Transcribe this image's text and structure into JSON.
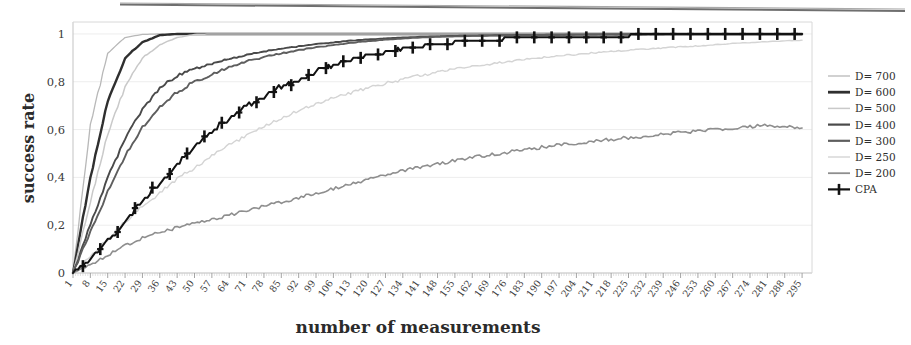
{
  "figure": {
    "background_color": "#ffffff",
    "scan_artifact": {
      "name": "page-edge-streak",
      "color": "#6f6f6f"
    }
  },
  "chart_data": {
    "type": "line",
    "title": "",
    "subtitle": "",
    "xlabel": "number of measurements",
    "ylabel": "success rate",
    "xlim": [
      1,
      299
    ],
    "ylim": [
      0,
      1.05
    ],
    "yticks": [
      0,
      0.2,
      0.4,
      0.6,
      0.8,
      1
    ],
    "ytick_labels": [
      "0",
      "0,2",
      "0,4",
      "0,6",
      "0,8",
      "1"
    ],
    "grid": "horizontal",
    "legend_position": "right",
    "x_tick_step": 7,
    "x": [
      1,
      8,
      15,
      22,
      29,
      36,
      43,
      50,
      57,
      64,
      71,
      78,
      85,
      92,
      99,
      106,
      113,
      120,
      127,
      134,
      141,
      148,
      155,
      162,
      169,
      176,
      183,
      190,
      197,
      204,
      211,
      218,
      225,
      232,
      239,
      246,
      253,
      260,
      267,
      274,
      281,
      288,
      295
    ],
    "xtick_labels": [
      "1",
      "8",
      "15",
      "22",
      "29",
      "36",
      "43",
      "50",
      "57",
      "64",
      "71",
      "78",
      "85",
      "92",
      "99",
      "106",
      "113",
      "120",
      "127",
      "134",
      "141",
      "148",
      "155",
      "162",
      "169",
      "176",
      "183",
      "190",
      "197",
      "204",
      "211",
      "218",
      "225",
      "232",
      "239",
      "246",
      "253",
      "260",
      "267",
      "274",
      "281",
      "288",
      "295"
    ],
    "series": [
      {
        "name": "D=700",
        "label": "D= 700",
        "color": "#b8b8b8",
        "width": 1.3,
        "marker": "none",
        "values": [
          0.0,
          0.62,
          0.92,
          0.985,
          0.998,
          1.0,
          1.0,
          1.0,
          1.0,
          1.0,
          1.0,
          1.0,
          1.0,
          1.0,
          1.0,
          1.0,
          1.0,
          1.0,
          1.0,
          1.0,
          1.0,
          1.0,
          1.0,
          1.0,
          1.0,
          1.0,
          1.0,
          1.0,
          1.0,
          1.0,
          1.0,
          1.0,
          1.0,
          1.0,
          1.0,
          1.0,
          1.0,
          1.0,
          1.0,
          1.0,
          1.0,
          1.0,
          1.0
        ]
      },
      {
        "name": "D=600",
        "label": "D= 600",
        "color": "#2f2f2f",
        "width": 2.4,
        "marker": "none",
        "values": [
          0.0,
          0.4,
          0.72,
          0.9,
          0.965,
          0.995,
          1.0,
          1.0,
          1.0,
          1.0,
          1.0,
          1.0,
          1.0,
          1.0,
          1.0,
          1.0,
          1.0,
          1.0,
          1.0,
          1.0,
          1.0,
          1.0,
          1.0,
          1.0,
          1.0,
          1.0,
          1.0,
          1.0,
          1.0,
          1.0,
          1.0,
          1.0,
          1.0,
          1.0,
          1.0,
          1.0,
          1.0,
          1.0,
          1.0,
          1.0,
          1.0,
          1.0,
          1.0
        ]
      },
      {
        "name": "D=500",
        "label": "D= 500",
        "color": "#c9c9c9",
        "width": 1.5,
        "marker": "none",
        "values": [
          0.0,
          0.3,
          0.58,
          0.78,
          0.9,
          0.955,
          0.985,
          0.998,
          1.0,
          1.0,
          1.0,
          1.0,
          1.0,
          1.0,
          1.0,
          1.0,
          1.0,
          1.0,
          1.0,
          1.0,
          1.0,
          1.0,
          1.0,
          1.0,
          1.0,
          1.0,
          1.0,
          1.0,
          1.0,
          1.0,
          1.0,
          1.0,
          1.0,
          1.0,
          1.0,
          1.0,
          1.0,
          1.0,
          1.0,
          1.0,
          1.0,
          1.0,
          1.0
        ]
      },
      {
        "name": "D=400",
        "label": "D= 400",
        "color": "#4a4a4a",
        "width": 1.9,
        "marker": "none",
        "values": [
          0.0,
          0.2,
          0.4,
          0.56,
          0.685,
          0.775,
          0.825,
          0.855,
          0.875,
          0.895,
          0.912,
          0.927,
          0.938,
          0.948,
          0.957,
          0.965,
          0.972,
          0.977,
          0.981,
          0.985,
          0.988,
          0.99,
          0.992,
          0.993,
          0.994,
          0.995,
          0.996,
          0.996,
          0.997,
          0.997,
          0.998,
          0.998,
          0.998,
          0.998,
          0.999,
          0.999,
          0.999,
          0.999,
          0.999,
          0.999,
          0.999,
          0.999,
          0.999
        ]
      },
      {
        "name": "D=300",
        "label": "D= 300",
        "color": "#5e5e5e",
        "width": 1.9,
        "marker": "none",
        "values": [
          0.0,
          0.17,
          0.34,
          0.49,
          0.61,
          0.695,
          0.757,
          0.8,
          0.833,
          0.862,
          0.885,
          0.903,
          0.919,
          0.932,
          0.944,
          0.954,
          0.963,
          0.97,
          0.976,
          0.981,
          0.985,
          0.988,
          0.99,
          0.992,
          0.993,
          0.994,
          0.995,
          0.996,
          0.996,
          0.997,
          0.997,
          0.998,
          0.998,
          0.998,
          0.998,
          0.999,
          0.999,
          0.999,
          0.999,
          0.999,
          0.999,
          0.999,
          0.999
        ]
      },
      {
        "name": "D=250",
        "label": "D= 250",
        "color": "#d4d4d4",
        "width": 1.4,
        "marker": "none",
        "values": [
          0.0,
          0.07,
          0.14,
          0.215,
          0.28,
          0.335,
          0.395,
          0.44,
          0.49,
          0.535,
          0.575,
          0.612,
          0.648,
          0.678,
          0.706,
          0.731,
          0.754,
          0.775,
          0.793,
          0.81,
          0.826,
          0.84,
          0.853,
          0.864,
          0.874,
          0.884,
          0.893,
          0.901,
          0.908,
          0.915,
          0.921,
          0.927,
          0.932,
          0.937,
          0.941,
          0.946,
          0.95,
          0.955,
          0.96,
          0.964,
          0.968,
          0.971,
          0.973
        ]
      },
      {
        "name": "D=200",
        "label": "D= 200",
        "color": "#8e8e8e",
        "width": 1.6,
        "marker": "none",
        "values": [
          0.0,
          0.035,
          0.075,
          0.115,
          0.148,
          0.17,
          0.19,
          0.207,
          0.223,
          0.243,
          0.262,
          0.278,
          0.297,
          0.316,
          0.335,
          0.354,
          0.373,
          0.392,
          0.41,
          0.428,
          0.443,
          0.457,
          0.47,
          0.483,
          0.494,
          0.505,
          0.516,
          0.526,
          0.535,
          0.544,
          0.552,
          0.559,
          0.566,
          0.573,
          0.58,
          0.587,
          0.594,
          0.6,
          0.606,
          0.612,
          0.617,
          0.614,
          0.609
        ]
      },
      {
        "name": "CPA",
        "label": "CPA",
        "color": "#121212",
        "width": 2.0,
        "marker": "cross",
        "values": [
          0.0,
          0.06,
          0.135,
          0.215,
          0.3,
          0.38,
          0.455,
          0.525,
          0.59,
          0.645,
          0.695,
          0.74,
          0.778,
          0.812,
          0.842,
          0.868,
          0.89,
          0.909,
          0.925,
          0.938,
          0.949,
          0.958,
          0.965,
          0.971,
          0.976,
          0.98,
          0.983,
          0.986,
          0.988,
          0.99,
          0.991,
          0.992,
          0.993,
          0.994,
          0.994,
          0.995,
          0.995,
          0.996,
          0.996,
          0.996,
          0.997,
          0.997,
          0.997
        ]
      }
    ],
    "legend": [
      {
        "label": "D= 700",
        "color": "#b8b8b8",
        "width": 1.3,
        "marker": "none"
      },
      {
        "label": "D= 600",
        "color": "#2f2f2f",
        "width": 2.8,
        "marker": "none"
      },
      {
        "label": "D= 500",
        "color": "#c9c9c9",
        "width": 1.5,
        "marker": "none"
      },
      {
        "label": "D= 400",
        "color": "#4a4a4a",
        "width": 2.2,
        "marker": "none"
      },
      {
        "label": "D= 300",
        "color": "#5e5e5e",
        "width": 2.2,
        "marker": "none"
      },
      {
        "label": "D= 250",
        "color": "#d4d4d4",
        "width": 1.4,
        "marker": "none"
      },
      {
        "label": "D= 200",
        "color": "#8e8e8e",
        "width": 1.8,
        "marker": "none"
      },
      {
        "label": "CPA",
        "color": "#121212",
        "width": 2.2,
        "marker": "cross"
      }
    ]
  }
}
